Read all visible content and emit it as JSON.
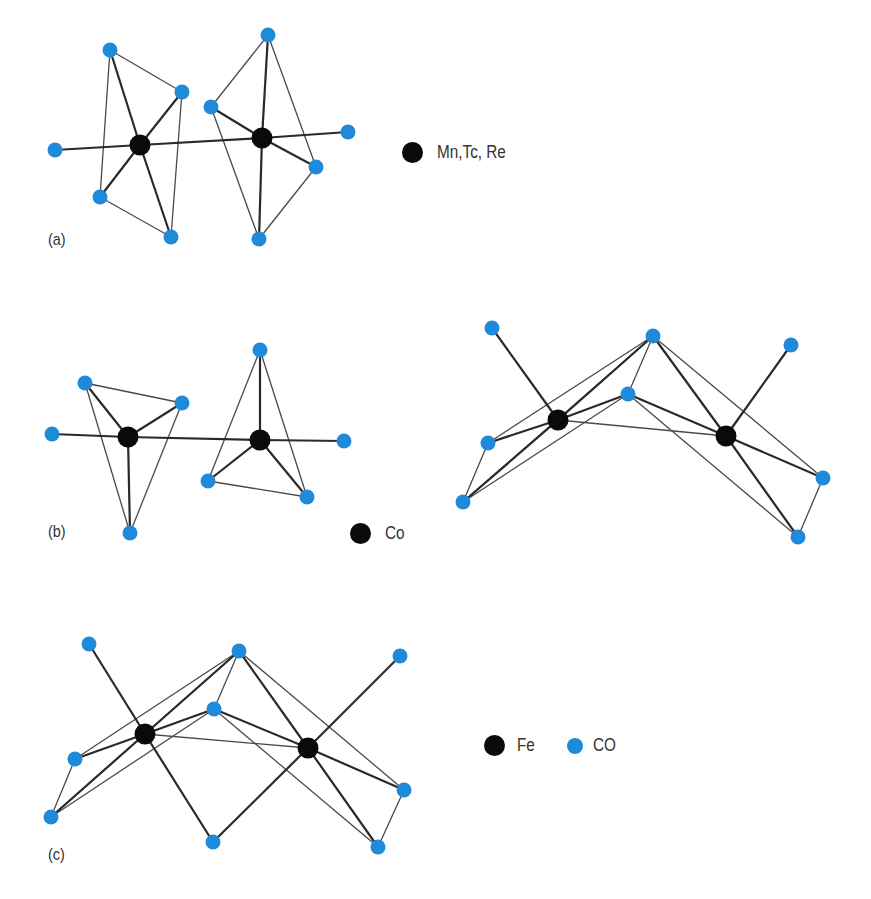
{
  "colors": {
    "metal": "#0a0a0a",
    "co": "#1f8ad9",
    "bond": "#2a2a2a"
  },
  "panels": [
    {
      "id": "a",
      "label": "(a)",
      "label_pos": [
        48,
        232
      ],
      "legend": {
        "label": "Mn,Tc, Re",
        "x": 402,
        "y": 142
      },
      "metals": [
        [
          140,
          145
        ],
        [
          262,
          138
        ]
      ],
      "cos": [
        [
          110,
          50
        ],
        [
          182,
          92
        ],
        [
          55,
          150
        ],
        [
          100,
          197
        ],
        [
          171,
          237
        ],
        [
          268,
          35
        ],
        [
          211,
          107
        ],
        [
          348,
          132
        ],
        [
          316,
          167
        ],
        [
          259,
          239
        ]
      ],
      "thick": [
        [
          [
            55,
            150
          ],
          [
            140,
            145
          ]
        ],
        [
          [
            140,
            145
          ],
          [
            262,
            138
          ]
        ],
        [
          [
            262,
            138
          ],
          [
            348,
            132
          ]
        ],
        [
          [
            110,
            50
          ],
          [
            140,
            145
          ]
        ],
        [
          [
            182,
            92
          ],
          [
            140,
            145
          ]
        ],
        [
          [
            100,
            197
          ],
          [
            140,
            145
          ]
        ],
        [
          [
            171,
            237
          ],
          [
            140,
            145
          ]
        ],
        [
          [
            268,
            35
          ],
          [
            262,
            138
          ]
        ],
        [
          [
            211,
            107
          ],
          [
            262,
            138
          ]
        ],
        [
          [
            316,
            167
          ],
          [
            262,
            138
          ]
        ],
        [
          [
            259,
            239
          ],
          [
            262,
            138
          ]
        ]
      ],
      "thin": [
        [
          [
            110,
            50
          ],
          [
            182,
            92
          ]
        ],
        [
          [
            110,
            50
          ],
          [
            100,
            197
          ]
        ],
        [
          [
            182,
            92
          ],
          [
            171,
            237
          ]
        ],
        [
          [
            100,
            197
          ],
          [
            171,
            237
          ]
        ],
        [
          [
            268,
            35
          ],
          [
            211,
            107
          ]
        ],
        [
          [
            268,
            35
          ],
          [
            316,
            167
          ]
        ],
        [
          [
            211,
            107
          ],
          [
            259,
            239
          ]
        ],
        [
          [
            316,
            167
          ],
          [
            259,
            239
          ]
        ]
      ]
    },
    {
      "id": "b",
      "label": "(b)",
      "label_pos": [
        48,
        523
      ],
      "legend": {
        "label": "Co",
        "x": 350,
        "y": 524
      },
      "metals": [
        [
          128,
          437
        ],
        [
          260,
          440
        ],
        [
          558,
          420
        ],
        [
          726,
          436
        ]
      ],
      "cos": [
        [
          85,
          383
        ],
        [
          182,
          403
        ],
        [
          52,
          434
        ],
        [
          130,
          533
        ],
        [
          260,
          350
        ],
        [
          344,
          441
        ],
        [
          208,
          481
        ],
        [
          307,
          497
        ],
        [
          492,
          328
        ],
        [
          653,
          336
        ],
        [
          628,
          394
        ],
        [
          791,
          345
        ],
        [
          488,
          443
        ],
        [
          463,
          502
        ],
        [
          823,
          478
        ],
        [
          798,
          537
        ]
      ],
      "thick": [
        [
          [
            52,
            434
          ],
          [
            128,
            437
          ]
        ],
        [
          [
            128,
            437
          ],
          [
            260,
            440
          ]
        ],
        [
          [
            260,
            440
          ],
          [
            344,
            441
          ]
        ],
        [
          [
            85,
            383
          ],
          [
            128,
            437
          ]
        ],
        [
          [
            182,
            403
          ],
          [
            128,
            437
          ]
        ],
        [
          [
            130,
            533
          ],
          [
            128,
            437
          ]
        ],
        [
          [
            260,
            350
          ],
          [
            260,
            440
          ]
        ],
        [
          [
            208,
            481
          ],
          [
            260,
            440
          ]
        ],
        [
          [
            307,
            497
          ],
          [
            260,
            440
          ]
        ],
        [
          [
            492,
            328
          ],
          [
            558,
            420
          ]
        ],
        [
          [
            653,
            336
          ],
          [
            558,
            420
          ]
        ],
        [
          [
            653,
            336
          ],
          [
            726,
            436
          ]
        ],
        [
          [
            628,
            394
          ],
          [
            558,
            420
          ]
        ],
        [
          [
            628,
            394
          ],
          [
            726,
            436
          ]
        ],
        [
          [
            488,
            443
          ],
          [
            558,
            420
          ]
        ],
        [
          [
            463,
            502
          ],
          [
            558,
            420
          ]
        ],
        [
          [
            791,
            345
          ],
          [
            726,
            436
          ]
        ],
        [
          [
            823,
            478
          ],
          [
            726,
            436
          ]
        ],
        [
          [
            798,
            537
          ],
          [
            726,
            436
          ]
        ]
      ],
      "thin": [
        [
          [
            85,
            383
          ],
          [
            182,
            403
          ]
        ],
        [
          [
            85,
            383
          ],
          [
            130,
            533
          ]
        ],
        [
          [
            182,
            403
          ],
          [
            130,
            533
          ]
        ],
        [
          [
            260,
            350
          ],
          [
            208,
            481
          ]
        ],
        [
          [
            260,
            350
          ],
          [
            307,
            497
          ]
        ],
        [
          [
            208,
            481
          ],
          [
            307,
            497
          ]
        ],
        [
          [
            653,
            336
          ],
          [
            628,
            394
          ]
        ],
        [
          [
            653,
            336
          ],
          [
            488,
            443
          ]
        ],
        [
          [
            653,
            336
          ],
          [
            463,
            502
          ]
        ],
        [
          [
            653,
            336
          ],
          [
            823,
            478
          ]
        ],
        [
          [
            628,
            394
          ],
          [
            463,
            502
          ]
        ],
        [
          [
            628,
            394
          ],
          [
            798,
            537
          ]
        ],
        [
          [
            488,
            443
          ],
          [
            463,
            502
          ]
        ],
        [
          [
            558,
            420
          ],
          [
            726,
            436
          ]
        ],
        [
          [
            823,
            478
          ],
          [
            798,
            537
          ]
        ]
      ]
    },
    {
      "id": "c",
      "label": "(c)",
      "label_pos": [
        48,
        845
      ],
      "legend": {
        "label": "Fe",
        "x": 484,
        "y": 736,
        "co_label": "CO",
        "co_x": 561
      },
      "metals": [
        [
          145,
          734
        ],
        [
          308,
          748
        ]
      ],
      "cos": [
        [
          89,
          644
        ],
        [
          239,
          651
        ],
        [
          214,
          709
        ],
        [
          400,
          656
        ],
        [
          75,
          759
        ],
        [
          51,
          817
        ],
        [
          404,
          790
        ],
        [
          378,
          847
        ],
        [
          213,
          842
        ]
      ],
      "thick": [
        [
          [
            89,
            644
          ],
          [
            145,
            734
          ]
        ],
        [
          [
            239,
            651
          ],
          [
            145,
            734
          ]
        ],
        [
          [
            239,
            651
          ],
          [
            308,
            748
          ]
        ],
        [
          [
            214,
            709
          ],
          [
            145,
            734
          ]
        ],
        [
          [
            214,
            709
          ],
          [
            308,
            748
          ]
        ],
        [
          [
            75,
            759
          ],
          [
            145,
            734
          ]
        ],
        [
          [
            51,
            817
          ],
          [
            145,
            734
          ]
        ],
        [
          [
            145,
            734
          ],
          [
            213,
            842
          ]
        ],
        [
          [
            308,
            748
          ],
          [
            213,
            842
          ]
        ],
        [
          [
            400,
            656
          ],
          [
            308,
            748
          ]
        ],
        [
          [
            404,
            790
          ],
          [
            308,
            748
          ]
        ],
        [
          [
            378,
            847
          ],
          [
            308,
            748
          ]
        ]
      ],
      "thin": [
        [
          [
            239,
            651
          ],
          [
            214,
            709
          ]
        ],
        [
          [
            239,
            651
          ],
          [
            75,
            759
          ]
        ],
        [
          [
            239,
            651
          ],
          [
            51,
            817
          ]
        ],
        [
          [
            239,
            651
          ],
          [
            404,
            790
          ]
        ],
        [
          [
            214,
            709
          ],
          [
            51,
            817
          ]
        ],
        [
          [
            214,
            709
          ],
          [
            378,
            847
          ]
        ],
        [
          [
            75,
            759
          ],
          [
            51,
            817
          ]
        ],
        [
          [
            145,
            734
          ],
          [
            308,
            748
          ]
        ],
        [
          [
            404,
            790
          ],
          [
            378,
            847
          ]
        ]
      ]
    }
  ]
}
